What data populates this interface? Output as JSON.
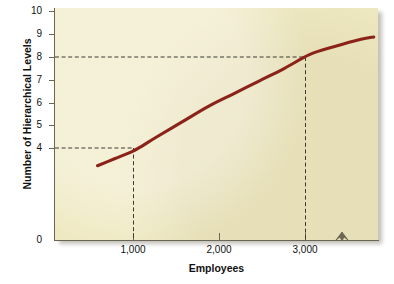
{
  "chart_data": {
    "type": "line",
    "title": "",
    "xlabel": "Employees",
    "ylabel": "Number of Hierarchical Levels",
    "xlim": [
      0,
      3800
    ],
    "ylim": [
      0,
      10
    ],
    "grid": false,
    "legend": null,
    "series": [
      {
        "name": "Hierarchical levels vs. employees",
        "color": "#8B2318",
        "x": [
          500,
          700,
          900,
          1000,
          1200,
          1500,
          1800,
          2100,
          2400,
          2700,
          3000,
          3300,
          3600,
          3750
        ],
        "y": [
          3.2,
          3.5,
          3.8,
          4.0,
          4.45,
          5.1,
          5.75,
          6.3,
          6.85,
          7.4,
          8.0,
          8.35,
          8.65,
          8.75
        ]
      }
    ],
    "annotations": [
      {
        "label": "1,000 employees → 4 levels",
        "x": 1000,
        "y": 4,
        "style": "dashed-guide"
      },
      {
        "label": "3,000 employees → 8 levels",
        "x": 3000,
        "y": 8,
        "style": "dashed-guide"
      }
    ],
    "x_ticks": [
      {
        "value": 1000,
        "label": "1,000"
      },
      {
        "value": 2000,
        "label": "2,000"
      },
      {
        "value": 3000,
        "label": "3,000"
      }
    ],
    "y_ticks": [
      {
        "value": 10,
        "label": "10"
      },
      {
        "value": 9,
        "label": "9"
      },
      {
        "value": 8,
        "label": "8"
      },
      {
        "value": 7,
        "label": "7"
      },
      {
        "value": 6,
        "label": "6"
      },
      {
        "value": 5,
        "label": "5"
      },
      {
        "value": 4,
        "label": "4"
      },
      {
        "value": 0,
        "label": "0"
      }
    ],
    "axis_break_marker": {
      "axis": "x",
      "position": 3500,
      "shape": "caret-notch"
    },
    "colors": {
      "plot_background": "#EFE9C2",
      "curve": "#8B2318",
      "axis": "#6B6554",
      "guide_dash": "#3A3A30",
      "text": "#111111",
      "page_background": "#FFFFFF"
    }
  }
}
